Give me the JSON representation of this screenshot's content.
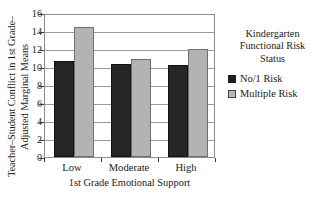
{
  "chart_data": {
    "type": "bar",
    "title": "",
    "categories": [
      "Low",
      "Moderate",
      "High"
    ],
    "series": [
      {
        "name": "No/1 Risk",
        "values": [
          10.65,
          10.3,
          10.25
        ],
        "color": "#262626"
      },
      {
        "name": "Multiple Risk",
        "values": [
          14.5,
          10.9,
          12.0
        ],
        "color": "#b3b3b3"
      }
    ],
    "xlabel": "1st Grade Emotional Support",
    "ylabel_lines": [
      "Teacher–Student Conflict in 1st Grade–",
      "Adjusted Marginal Means"
    ],
    "ylim": [
      0,
      16
    ],
    "yticks": [
      0,
      2,
      4,
      6,
      8,
      10,
      12,
      14,
      16
    ],
    "ytick_labels": [
      "0",
      "2",
      "4",
      "6",
      "8",
      "10",
      "12",
      "14",
      "16"
    ],
    "grid": true,
    "legend_position": "right"
  },
  "legend": {
    "title_lines": [
      "Kindergarten",
      "Functional Risk",
      "Status"
    ],
    "items": [
      {
        "label": "No/1 Risk",
        "swatch": "dark"
      },
      {
        "label": "Multiple Risk",
        "swatch": "light"
      }
    ]
  }
}
